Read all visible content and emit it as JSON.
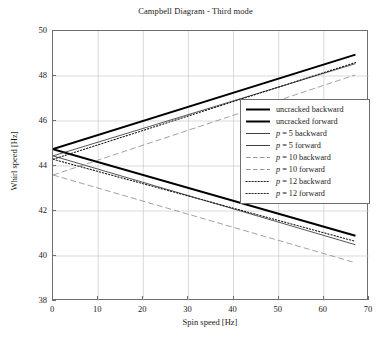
{
  "chart_data": {
    "type": "line",
    "title": "Campbell Diagram - Third mode",
    "xlabel": "Spin speed [Hz]",
    "ylabel": "Whirl speed [Hz]",
    "xlim": [
      0,
      70
    ],
    "ylim": [
      38,
      50
    ],
    "xticks": [
      0,
      10,
      20,
      30,
      40,
      50,
      60,
      70
    ],
    "yticks": [
      38,
      40,
      42,
      44,
      46,
      48,
      50
    ],
    "grid": true,
    "legend_position": "center-right",
    "x": [
      0,
      67
    ],
    "series": [
      {
        "name": "uncracked backward",
        "values": [
          44.75,
          40.9
        ],
        "style": "solid",
        "width": 2.0,
        "color": "#000000"
      },
      {
        "name": "uncracked forward",
        "values": [
          44.75,
          48.95
        ],
        "style": "solid",
        "width": 2.0,
        "color": "#000000"
      },
      {
        "name": "p = 5 backward",
        "values": [
          44.45,
          40.5
        ],
        "style": "solid",
        "width": 0.8,
        "color": "#2b2b2b"
      },
      {
        "name": "p = 5 forward",
        "values": [
          44.45,
          48.55
        ],
        "style": "solid",
        "width": 0.8,
        "color": "#2b2b2b"
      },
      {
        "name": "p = 10 backward",
        "values": [
          43.6,
          39.7
        ],
        "style": "dashed",
        "width": 0.8,
        "color": "#8a8a8a"
      },
      {
        "name": "p = 10 forward",
        "values": [
          43.6,
          48.05
        ],
        "style": "dashed",
        "width": 0.8,
        "color": "#8a8a8a"
      },
      {
        "name": "p = 12 backward",
        "values": [
          44.3,
          40.65
        ],
        "style": "dotted",
        "width": 1.1,
        "color": "#1a1a1a"
      },
      {
        "name": "p = 12 forward",
        "values": [
          44.3,
          48.6
        ],
        "style": "dotted",
        "width": 1.1,
        "color": "#1a1a1a"
      }
    ]
  },
  "legend": {
    "items": [
      {
        "label_prefix": "",
        "label_italic": "",
        "label_rest": "uncracked backward",
        "style": "solid-thick"
      },
      {
        "label_prefix": "",
        "label_italic": "",
        "label_rest": "uncracked forward",
        "style": "solid-thick"
      },
      {
        "label_prefix": "",
        "label_italic": "p",
        "label_rest": " = 5 backward",
        "style": "solid-thin"
      },
      {
        "label_prefix": "",
        "label_italic": "p",
        "label_rest": " = 5 forward",
        "style": "solid-thin"
      },
      {
        "label_prefix": "",
        "label_italic": "p",
        "label_rest": " = 10 backward",
        "style": "dashed"
      },
      {
        "label_prefix": "",
        "label_italic": "p",
        "label_rest": " = 10 forward",
        "style": "dashed"
      },
      {
        "label_prefix": "",
        "label_italic": "p",
        "label_rest": " = 12 backward",
        "style": "dotted"
      },
      {
        "label_prefix": "",
        "label_italic": "p",
        "label_rest": " = 12 forward",
        "style": "dotted"
      }
    ]
  },
  "colors": {
    "axis": "#6e6e6e",
    "grid": "#c8c8c8",
    "text": "#1a1a1a",
    "background": "#ffffff"
  }
}
